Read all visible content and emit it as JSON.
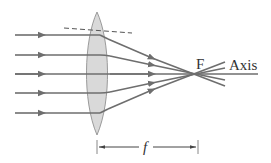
{
  "diagram": {
    "labels": {
      "focal_point": "F",
      "axis": "Axis",
      "focal_length": "f"
    },
    "colors": {
      "ray": "#6e6e6e",
      "lens_fill": "#d9d9d9",
      "lens_stroke": "#9a9a9a",
      "text": "#333333"
    },
    "rays": [
      {
        "y": 35
      },
      {
        "y": 55
      },
      {
        "y": 74
      },
      {
        "y": 93
      },
      {
        "y": 113
      }
    ],
    "focal_point": {
      "x": 203,
      "y": 74
    },
    "lens": {
      "center_x": 97,
      "top_y": 12,
      "bottom_y": 135,
      "half_width": 15
    }
  }
}
